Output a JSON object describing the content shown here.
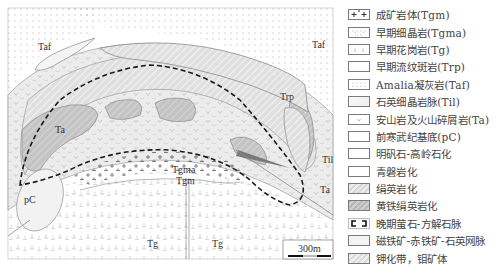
{
  "map": {
    "labels": {
      "taf_left": "Taf",
      "taf_right": "Taf",
      "trp": "Trp",
      "ta_left": "Ta",
      "ta_right": "Ta",
      "til": "Til",
      "pc": "pC",
      "tgma": "Tgma",
      "tgm": "Tgm",
      "tg_left": "Tg",
      "tg_center": "Tg"
    },
    "scale_bar": {
      "label": "300m"
    }
  },
  "legend": {
    "items": [
      {
        "key": "tgm",
        "label": "成矿岩体(Tgm)",
        "pattern": "cross-large"
      },
      {
        "key": "tgma",
        "label": "早期细晶岩(Tgma)",
        "pattern": "aplite"
      },
      {
        "key": "tg",
        "label": "早期花岗岩(Tg)",
        "pattern": "granite"
      },
      {
        "key": "trp",
        "label": "早期流纹斑岩(Trp)",
        "pattern": "blank"
      },
      {
        "key": "taf",
        "label": "Amalia凝灰岩(Taf)",
        "pattern": "dots"
      },
      {
        "key": "til",
        "label": "石英细晶岩脉(Til)",
        "pattern": "blank"
      },
      {
        "key": "ta",
        "label": "安山岩及火山碎屑岩(Ta)",
        "pattern": "v"
      },
      {
        "key": "pc",
        "label": "前寒武纪基底(pC)",
        "pattern": "blank"
      },
      {
        "key": "alunite",
        "label": "明矾石-高岭石化",
        "pattern": "blank"
      },
      {
        "key": "propylitic",
        "label": "青磐岩化",
        "pattern": "blank"
      },
      {
        "key": "phyllic",
        "label": "绢英岩化",
        "pattern": "hatch-light"
      },
      {
        "key": "pyrite_phyllic",
        "label": "黄铁绢英岩化",
        "pattern": "hatch-dark"
      },
      {
        "key": "fluorite_calcite",
        "label": "晚期萤石-方解石脉",
        "pattern": "dashed-border"
      },
      {
        "key": "magnetite",
        "label": "磁铁矿-赤铁矿-石英网脉",
        "pattern": "light"
      },
      {
        "key": "potassic",
        "label": "钾化带，钼矿体",
        "pattern": "hatch-light"
      }
    ]
  },
  "colors": {
    "line": "#8a8a8a",
    "dashed": "#1a1a1a",
    "phyllic": "#dcdcdc",
    "pyrite_phyllic": "#bdbdbd",
    "andesite": "#e6e6e6",
    "potassic": "#ececec"
  }
}
